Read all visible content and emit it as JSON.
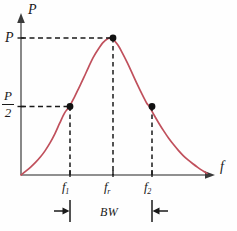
{
  "figure": {
    "background_color": "#fefefe"
  },
  "axes": {
    "y_axis_title": "P",
    "x_axis_title": "f",
    "axis_color": "#6b6b6b"
  },
  "value_labels": {
    "peak": "P",
    "half_numerator": "P",
    "half_denominator": "2"
  },
  "tick_labels": {
    "f1_main": "f",
    "f1_sub": "1",
    "fr_main": "f",
    "fr_sub": "r",
    "f2_main": "f",
    "f2_sub": "2"
  },
  "annotations": {
    "bandwidth_label": "BW"
  },
  "chart_data": {
    "type": "line",
    "xlabel": "f",
    "ylabel": "P",
    "grid": false,
    "legend": null,
    "curve_color": "#c0505c",
    "marker_color": "#111111",
    "axis_color": "#6b6b6b",
    "xlim": [
      0,
      1
    ],
    "ylim": [
      0,
      1
    ],
    "x_tick_labels": [
      "f1",
      "fr",
      "f2"
    ],
    "x_tick_values": [
      0.26,
      0.48,
      0.69
    ],
    "y_tick_labels": [
      "P/2",
      "P"
    ],
    "y_tick_values": [
      0.5,
      1.0
    ],
    "annotations": [
      {
        "text": "BW",
        "type": "dimension",
        "from": "f1",
        "to": "f2"
      }
    ],
    "markers": [
      {
        "label": "f1",
        "x": 0.26,
        "y": 0.5
      },
      {
        "label": "fr",
        "x": 0.48,
        "y": 1.0
      },
      {
        "label": "f2",
        "x": 0.69,
        "y": 0.5
      }
    ],
    "series": [
      {
        "name": "power",
        "x": [
          0.0,
          0.026,
          0.052,
          0.078,
          0.104,
          0.13,
          0.156,
          0.182,
          0.208,
          0.234,
          0.26,
          0.286,
          0.312,
          0.338,
          0.364,
          0.39,
          0.416,
          0.442,
          0.468,
          0.48,
          0.494,
          0.52,
          0.546,
          0.572,
          0.598,
          0.624,
          0.65,
          0.676,
          0.69,
          0.716,
          0.742,
          0.768,
          0.794,
          0.82,
          0.846,
          0.872,
          0.898,
          0.924,
          0.95,
          0.976,
          1.0
        ],
        "y": [
          0.0,
          0.028,
          0.058,
          0.092,
          0.131,
          0.178,
          0.234,
          0.3,
          0.378,
          0.452,
          0.5,
          0.565,
          0.638,
          0.712,
          0.79,
          0.862,
          0.92,
          0.968,
          0.996,
          1.0,
          0.992,
          0.95,
          0.888,
          0.818,
          0.742,
          0.665,
          0.592,
          0.524,
          0.5,
          0.436,
          0.376,
          0.32,
          0.268,
          0.222,
          0.18,
          0.142,
          0.11,
          0.082,
          0.056,
          0.032,
          0.012
        ]
      }
    ]
  }
}
